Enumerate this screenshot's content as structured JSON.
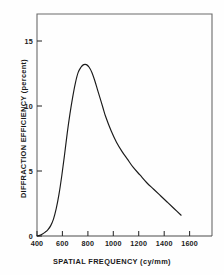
{
  "chart_data": {
    "type": "line",
    "title": "",
    "xlabel": "SPATIAL FREQUENCY (cy/mm)",
    "ylabel": "DIFFRACTION EFFICIENCY (percent)",
    "xlim": [
      400,
      1675
    ],
    "ylim": [
      0,
      17.1
    ],
    "xticks": [
      400,
      600,
      800,
      1000,
      1200,
      1400,
      1600
    ],
    "xtick_labels": [
      "400",
      "600",
      "800",
      "1000",
      "1200",
      "1400",
      "1600"
    ],
    "yticks": [
      0,
      5,
      10,
      15
    ],
    "ytick_labels": [
      "0",
      "5",
      "10",
      "15"
    ],
    "grid": false,
    "legend": null,
    "line_color": "#1a1a1a",
    "frame_color": "#555555",
    "background": "#fefefe",
    "series": [
      {
        "name": "Diffraction efficiency",
        "x": [
          400,
          420,
          440,
          460,
          480,
          500,
          520,
          540,
          560,
          580,
          600,
          620,
          640,
          660,
          680,
          700,
          720,
          740,
          760,
          780,
          800,
          820,
          840,
          860,
          880,
          900,
          940,
          980,
          1020,
          1060,
          1100,
          1150,
          1200,
          1250,
          1300,
          1350,
          1400,
          1450
        ],
        "y": [
          0.0,
          0.05,
          0.15,
          0.3,
          0.5,
          0.8,
          1.3,
          2.1,
          3.2,
          4.6,
          6.2,
          7.9,
          9.4,
          10.7,
          11.8,
          12.6,
          13.0,
          13.2,
          13.2,
          13.0,
          12.6,
          12.0,
          11.3,
          10.6,
          9.9,
          9.2,
          8.1,
          7.2,
          6.5,
          5.9,
          5.3,
          4.7,
          4.1,
          3.6,
          3.1,
          2.6,
          2.1,
          1.6
        ]
      }
    ],
    "annotations": []
  },
  "axes": {
    "x_title": "SPATIAL FREQUENCY (cy/mm)",
    "y_title": "DIFFRACTION EFFICIENCY (percent)"
  }
}
